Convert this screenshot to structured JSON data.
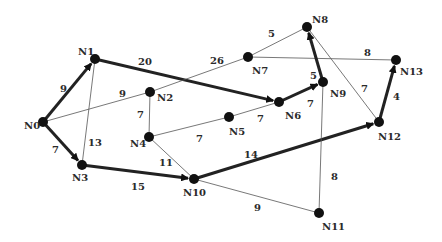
{
  "graph": {
    "nodes": [
      {
        "id": "N0",
        "x": 43,
        "y": 122,
        "lx": 24,
        "ly": 129
      },
      {
        "id": "N1",
        "x": 95,
        "y": 59,
        "lx": 78,
        "ly": 55
      },
      {
        "id": "N2",
        "x": 150,
        "y": 92,
        "lx": 157,
        "ly": 101
      },
      {
        "id": "N3",
        "x": 82,
        "y": 165,
        "lx": 72,
        "ly": 181
      },
      {
        "id": "N4",
        "x": 149,
        "y": 137,
        "lx": 130,
        "ly": 147
      },
      {
        "id": "N5",
        "x": 229,
        "y": 117,
        "lx": 229,
        "ly": 135
      },
      {
        "id": "N6",
        "x": 279,
        "y": 102,
        "lx": 285,
        "ly": 119
      },
      {
        "id": "N7",
        "x": 248,
        "y": 57,
        "lx": 252,
        "ly": 74
      },
      {
        "id": "N8",
        "x": 307,
        "y": 27,
        "lx": 312,
        "ly": 23
      },
      {
        "id": "N9",
        "x": 323,
        "y": 82,
        "lx": 330,
        "ly": 97
      },
      {
        "id": "N10",
        "x": 194,
        "y": 179,
        "lx": 183,
        "ly": 196
      },
      {
        "id": "N11",
        "x": 319,
        "y": 213,
        "lx": 322,
        "ly": 230
      },
      {
        "id": "N12",
        "x": 379,
        "y": 122,
        "lx": 378,
        "ly": 140
      },
      {
        "id": "N13",
        "x": 396,
        "y": 60,
        "lx": 400,
        "ly": 75
      }
    ],
    "edges": [
      {
        "from": "N0",
        "to": "N1",
        "weight": "9",
        "bold": true,
        "arrow": true,
        "lx": 60,
        "ly": 92
      },
      {
        "from": "N0",
        "to": "N3",
        "weight": "7",
        "bold": true,
        "arrow": true,
        "lx": 52,
        "ly": 153
      },
      {
        "from": "N0",
        "to": "N2",
        "weight": "9",
        "bold": false,
        "arrow": false,
        "lx": 119,
        "ly": 97
      },
      {
        "from": "N1",
        "to": "N3",
        "weight": "13",
        "bold": false,
        "arrow": false,
        "lx": 88,
        "ly": 146
      },
      {
        "from": "N1",
        "to": "N6",
        "weight": "20",
        "bold": true,
        "arrow": true,
        "lx": 138,
        "ly": 65
      },
      {
        "from": "N2",
        "to": "N7",
        "weight": "26",
        "bold": false,
        "arrow": false,
        "lx": 210,
        "ly": 64
      },
      {
        "from": "N2",
        "to": "N4",
        "weight": "7",
        "bold": false,
        "arrow": false,
        "lx": 137,
        "ly": 118
      },
      {
        "from": "N4",
        "to": "N5",
        "weight": "7",
        "bold": false,
        "arrow": false,
        "lx": 196,
        "ly": 142
      },
      {
        "from": "N5",
        "to": "N6",
        "weight": "7",
        "bold": false,
        "arrow": false,
        "lx": 257,
        "ly": 122
      },
      {
        "from": "N4",
        "to": "N10",
        "weight": "11",
        "bold": false,
        "arrow": false,
        "lx": 159,
        "ly": 166
      },
      {
        "from": "N3",
        "to": "N10",
        "weight": "15",
        "bold": true,
        "arrow": true,
        "lx": 131,
        "ly": 190
      },
      {
        "from": "N10",
        "to": "N12",
        "weight": "14",
        "bold": true,
        "arrow": true,
        "lx": 244,
        "ly": 158
      },
      {
        "from": "N10",
        "to": "N11",
        "weight": "9",
        "bold": false,
        "arrow": false,
        "lx": 254,
        "ly": 211
      },
      {
        "from": "N7",
        "to": "N8",
        "weight": "5",
        "bold": false,
        "arrow": false,
        "lx": 268,
        "ly": 37
      },
      {
        "from": "N7",
        "to": "N13",
        "weight": "8",
        "bold": false,
        "arrow": false,
        "lx": 364,
        "ly": 56
      },
      {
        "from": "N6",
        "to": "N9",
        "weight": "7",
        "bold": true,
        "arrow": true,
        "lx": 307,
        "ly": 107
      },
      {
        "from": "N9",
        "to": "N8",
        "weight": "5",
        "bold": true,
        "arrow": true,
        "lx": 310,
        "ly": 79
      },
      {
        "from": "N8",
        "to": "N12",
        "weight": "7",
        "bold": false,
        "arrow": false,
        "lx": 361,
        "ly": 92
      },
      {
        "from": "N9",
        "to": "N11",
        "weight": "8",
        "bold": false,
        "arrow": false,
        "lx": 331,
        "ly": 180
      },
      {
        "from": "N12",
        "to": "N13",
        "weight": "4",
        "bold": true,
        "arrow": true,
        "lx": 393,
        "ly": 100
      }
    ]
  },
  "style": {
    "node_color": "#111111",
    "edge_color": "#222222",
    "thin_edge_color": "#555555"
  }
}
